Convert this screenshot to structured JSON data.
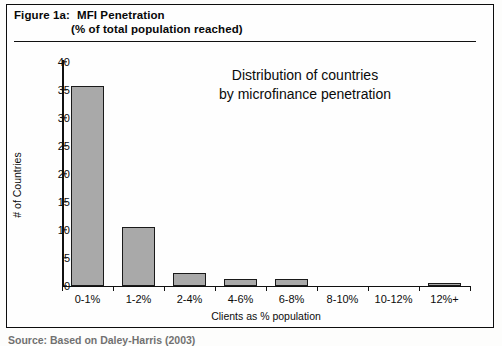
{
  "figure": {
    "label": "Figure 1a:",
    "title_line1": "MFI Penetration",
    "title_line2": "(% of total population reached)",
    "source_note": "Source: Based on Daley-Harris (2003)"
  },
  "chart_data": {
    "type": "bar",
    "title": "Distribution of countries\nby microfinance penetration",
    "title_line1": "Distribution of countries",
    "title_line2": "by microfinance penetration",
    "categories": [
      "0-1%",
      "1-2%",
      "2-4%",
      "4-6%",
      "6-8%",
      "8-10%",
      "10-12%",
      "12%+"
    ],
    "values": [
      35.8,
      10.6,
      2.4,
      1.3,
      1.3,
      0,
      0,
      0.6
    ],
    "xlabel": "Clients as % population",
    "ylabel": "# of Countries",
    "ylim": [
      0,
      40
    ],
    "ytick_labels": [
      "0",
      "5",
      "10",
      "15",
      "20",
      "25",
      "30",
      "35",
      "40"
    ],
    "ytick_values": [
      0,
      5,
      10,
      15,
      20,
      25,
      30,
      35,
      40
    ],
    "grid": false,
    "legend": "none",
    "bar_color": "#a9a9a9",
    "bar_edge_color": "#1a1a1a",
    "axis_color": "#101010",
    "background": "#fefefe"
  }
}
